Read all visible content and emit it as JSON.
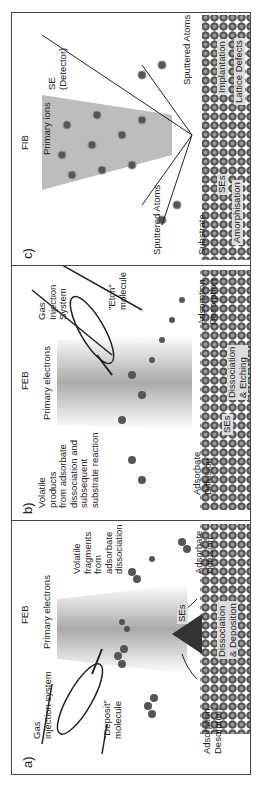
{
  "panels": [
    {
      "id": "a",
      "label": "a)",
      "beam_source": "FEB",
      "beam_label": "Primary electrons",
      "labels": {
        "gis": [
          "Gas",
          "injection system"
        ],
        "molecule": [
          "\"Deposit\"",
          "molecule"
        ],
        "ads_des": [
          "Adsorption",
          "Desorption"
        ],
        "volatile": [
          "Volatile",
          "fragments",
          "from",
          "adsorbate",
          "dissociation"
        ],
        "diffusion": [
          "Adsorbate",
          "Diffusion"
        ],
        "ses": "SEs",
        "process": [
          "Dissociation",
          "& Deposition"
        ]
      }
    },
    {
      "id": "b",
      "label": "b)",
      "beam_source": "FEB",
      "beam_label": "Primary electrons",
      "labels": {
        "volatile": [
          "Volatile",
          "products",
          "from adsorbate",
          "dissociation and",
          "subsequent",
          "substrate reaction"
        ],
        "diffusion": [
          "Adsorbate",
          "Diffusion"
        ],
        "gis": [
          "Gas",
          "Injection",
          "System"
        ],
        "molecule": [
          "\"Etch\"",
          "molecule"
        ],
        "ads_des": [
          "Adsorption",
          "Desorption"
        ],
        "ses": "SEs",
        "process": [
          "Dissociation",
          "& Etching"
        ]
      }
    },
    {
      "id": "c",
      "label": "c)",
      "beam_source": "FIB",
      "beam_label": "Primary ions",
      "labels": {
        "sputtered_left": "Sputtered Atoms",
        "substrate": "Substrate",
        "sputtered_right": "Sputtered Atoms",
        "se_detector": [
          "SE",
          "(Detector)"
        ],
        "ses": "SEs",
        "amorph": "Amorphisation",
        "implant": "Implantation",
        "lattice": "Lattice Defects"
      }
    }
  ],
  "colors": {
    "atom": "#555555",
    "atom_core": "#9a9a9a",
    "beam": "#bdbdbd",
    "border": "#444444"
  }
}
